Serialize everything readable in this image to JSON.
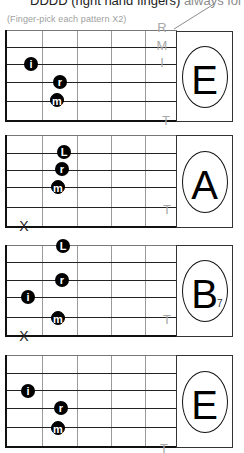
{
  "header": {
    "caption_dark": "DDDD (right hand fingers)",
    "caption_light": " always fol",
    "subcaption": "(Finger-pick each pattern X2)"
  },
  "pick_labels": [
    "R",
    "M",
    "I",
    "T"
  ],
  "grid": {
    "frets_x": [
      7,
      42,
      77,
      111,
      145
    ],
    "right_x": 177,
    "box": {
      "left": 176,
      "right": 233
    }
  },
  "colors": {
    "ink": "#000000",
    "label_gray": "#a8a8a8",
    "line": "#222222"
  },
  "panels": [
    {
      "chord": "E",
      "sub": "",
      "strings_y": [
        30,
        47,
        64,
        82,
        101,
        120
      ],
      "dots": [
        {
          "finger": "i",
          "x": 31,
          "y": 64
        },
        {
          "finger": "r",
          "x": 60,
          "y": 82
        },
        {
          "finger": "m",
          "x": 57,
          "y": 100
        }
      ],
      "markers": [
        {
          "label": "R",
          "x": 162,
          "y": 27
        },
        {
          "label": "M",
          "x": 162,
          "y": 45
        },
        {
          "label": "I",
          "x": 162,
          "y": 62
        },
        {
          "label": "T",
          "x": 166,
          "y": 120
        }
      ],
      "mutes": []
    },
    {
      "chord": "A",
      "sub": "",
      "strings_y": [
        135,
        153,
        170,
        187,
        207,
        226
      ],
      "dots": [
        {
          "finger": "L",
          "x": 64,
          "y": 152
        },
        {
          "finger": "r",
          "x": 62,
          "y": 169
        },
        {
          "finger": "m",
          "x": 58,
          "y": 187
        }
      ],
      "markers": [
        {
          "label": "T",
          "x": 167,
          "y": 209
        }
      ],
      "mutes": [
        {
          "label": "X",
          "x": 24,
          "y": 226
        }
      ]
    },
    {
      "chord": "B",
      "sub": "7",
      "strings_y": [
        245,
        262,
        280,
        297,
        317,
        335
      ],
      "dots": [
        {
          "finger": "L",
          "x": 63,
          "y": 246
        },
        {
          "finger": "r",
          "x": 62,
          "y": 280
        },
        {
          "finger": "i",
          "x": 28,
          "y": 297
        },
        {
          "finger": "m",
          "x": 58,
          "y": 318
        }
      ],
      "markers": [
        {
          "label": "T",
          "x": 167,
          "y": 319
        }
      ],
      "mutes": [
        {
          "label": "X",
          "x": 24,
          "y": 336
        }
      ]
    },
    {
      "chord": "E",
      "sub": "",
      "strings_y": [
        355,
        373,
        390,
        408,
        427,
        446
      ],
      "dots": [
        {
          "finger": "i",
          "x": 28,
          "y": 391
        },
        {
          "finger": "r",
          "x": 61,
          "y": 408
        },
        {
          "finger": "m",
          "x": 58,
          "y": 428
        }
      ],
      "markers": [
        {
          "label": "T",
          "x": 164,
          "y": 448
        }
      ],
      "mutes": []
    }
  ]
}
